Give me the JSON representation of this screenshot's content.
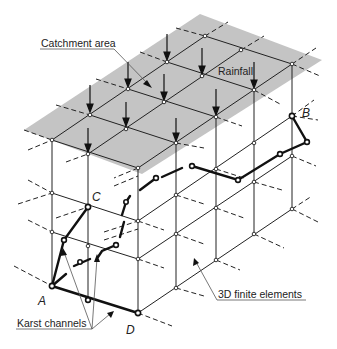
{
  "figure": {
    "labels": {
      "catchment_area": "Catchment area",
      "rainfall": "Rainfall",
      "finite_elements": "3D finite elements",
      "karst_channels": "Karst channels"
    },
    "points": {
      "A": "A",
      "B": "B",
      "C": "C",
      "D": "D"
    },
    "colors": {
      "catchment_fill": "#c4c4c4",
      "grid_line": "#222222",
      "channel_line": "#111111",
      "leader_line": "#555555"
    }
  }
}
